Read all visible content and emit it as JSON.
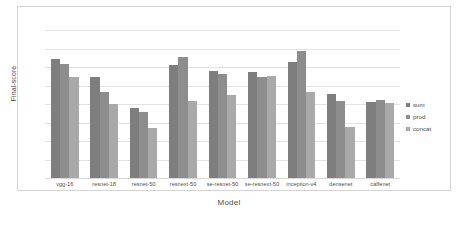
{
  "chart_data": {
    "type": "bar",
    "title": "",
    "xlabel": "Model",
    "ylabel": "Final-score",
    "ylim": [
      0.6,
      0.77
    ],
    "yticks": [
      0.6,
      0.62,
      0.64,
      0.66,
      0.68,
      0.7,
      0.72,
      0.74,
      0.76
    ],
    "ytick_labels": [
      "0.6",
      "0.62",
      "0.64",
      "0.66",
      "0.68",
      "0.7",
      "0.72",
      "0.74",
      "0.76"
    ],
    "grid": true,
    "legend_position": "right",
    "categories": [
      "vgg-16",
      "resnet-18",
      "resnet-50",
      "resnext-50",
      "se-resnet-50",
      "se-resnext-50",
      "inception-v4",
      "densenet",
      "caffenet"
    ],
    "series": [
      {
        "name": "sum",
        "color": "#7e7e7e",
        "values": [
          0.729,
          0.709,
          0.676,
          0.722,
          0.716,
          0.715,
          0.726,
          0.691,
          0.682
        ]
      },
      {
        "name": "prod",
        "color": "#8d8d8d",
        "values": [
          0.723,
          0.693,
          0.671,
          0.731,
          0.713,
          0.709,
          0.737,
          0.683,
          0.684
        ]
      },
      {
        "name": "concat",
        "color": "#a9a9a9",
        "values": [
          0.709,
          0.68,
          0.654,
          0.683,
          0.69,
          0.711,
          0.693,
          0.655,
          0.681
        ]
      }
    ]
  },
  "legend": {
    "items": [
      {
        "label": "sum"
      },
      {
        "label": "prod"
      },
      {
        "label": "concat"
      }
    ]
  }
}
